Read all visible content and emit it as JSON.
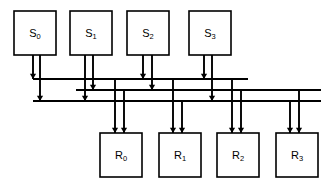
{
  "diagram": {
    "type": "block-diagram",
    "colors": {
      "line": "#000000",
      "background": "#ffffff",
      "box_fill": "#ffffff"
    },
    "sources": [
      {
        "id": "S0",
        "label": "S",
        "sub": "0",
        "x": 14,
        "y": 11,
        "w": 42,
        "h": 44,
        "cx": 35
      },
      {
        "id": "S1",
        "label": "S",
        "sub": "1",
        "x": 70,
        "y": 11,
        "w": 42,
        "h": 44,
        "cx": 91
      },
      {
        "id": "S2",
        "label": "S",
        "sub": "2",
        "x": 127,
        "y": 11,
        "w": 42,
        "h": 44,
        "cx": 148
      },
      {
        "id": "S3",
        "label": "S",
        "sub": "3",
        "x": 189,
        "y": 11,
        "w": 42,
        "h": 44,
        "cx": 210
      }
    ],
    "receivers": [
      {
        "id": "R0",
        "label": "R",
        "sub": "0",
        "x": 100,
        "y": 133,
        "w": 42,
        "h": 44,
        "cx": 121
      },
      {
        "id": "R1",
        "label": "R",
        "sub": "1",
        "x": 159,
        "y": 133,
        "w": 42,
        "h": 44,
        "cx": 180
      },
      {
        "id": "R2",
        "label": "R",
        "sub": "2",
        "x": 217,
        "y": 133,
        "w": 42,
        "h": 44,
        "cx": 238
      },
      {
        "id": "R3",
        "label": "R",
        "sub": "3",
        "x": 276,
        "y": 133,
        "w": 42,
        "h": 44,
        "cx": 297
      }
    ],
    "buses": [
      {
        "id": "bus-1",
        "y": 79,
        "x1": 33,
        "x2": 248
      },
      {
        "id": "bus-2",
        "y": 90,
        "x1": 76,
        "x2": 321
      },
      {
        "id": "bus-3",
        "y": 101,
        "x1": 33,
        "x2": 321
      }
    ],
    "source_drops": [
      {
        "id": "S0-to-bus1",
        "x": 33,
        "y1": 55,
        "y2": 79,
        "arrow": true
      },
      {
        "id": "S0-to-bus3",
        "x": 40,
        "y1": 55,
        "y2": 101,
        "arrow": true
      },
      {
        "id": "S1-to-bus3",
        "x": 85,
        "y1": 55,
        "y2": 101,
        "arrow": true
      },
      {
        "id": "S1-to-bus2",
        "x": 93,
        "y1": 55,
        "y2": 90,
        "arrow": true
      },
      {
        "id": "S2-to-bus1",
        "x": 143,
        "y1": 55,
        "y2": 79,
        "arrow": true
      },
      {
        "id": "S2-to-bus2",
        "x": 152,
        "y1": 55,
        "y2": 90,
        "arrow": true
      },
      {
        "id": "S3-to-bus1",
        "x": 204,
        "y1": 55,
        "y2": 79,
        "arrow": true
      },
      {
        "id": "S3-to-bus3",
        "x": 212,
        "y1": 55,
        "y2": 101,
        "arrow": true
      }
    ],
    "receiver_drops": [
      {
        "id": "bus1-to-R0",
        "x": 115,
        "y1": 79,
        "y2": 133,
        "arrow": true
      },
      {
        "id": "bus2-to-R0",
        "x": 124,
        "y1": 90,
        "y2": 133,
        "arrow": true
      },
      {
        "id": "bus1-to-R1",
        "x": 173,
        "y1": 79,
        "y2": 133,
        "arrow": true
      },
      {
        "id": "bus3-to-R1",
        "x": 182,
        "y1": 101,
        "y2": 133,
        "arrow": true
      },
      {
        "id": "bus1-to-R2",
        "x": 232,
        "y1": 79,
        "y2": 133,
        "arrow": true
      },
      {
        "id": "bus2-to-R2",
        "x": 241,
        "y1": 90,
        "y2": 133,
        "arrow": true
      },
      {
        "id": "bus3-to-R3",
        "x": 290,
        "y1": 101,
        "y2": 133,
        "arrow": true
      },
      {
        "id": "bus2-to-R3",
        "x": 299,
        "y1": 90,
        "y2": 133,
        "arrow": true
      }
    ]
  }
}
